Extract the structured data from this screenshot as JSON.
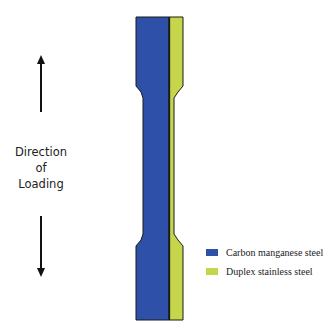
{
  "diagram": {
    "type": "tensile-specimen-schematic",
    "direction_label_lines": [
      "Direction",
      "of",
      "Loading"
    ],
    "arrows": [
      {
        "name": "up-arrow",
        "direction": "up"
      },
      {
        "name": "down-arrow",
        "direction": "down"
      }
    ],
    "materials": {
      "carbon": {
        "label": "Carbon manganese steel",
        "color": "#2e50a8"
      },
      "duplex": {
        "label": "Duplex stainless steel",
        "color": "#c6d64a"
      }
    }
  },
  "legend": {
    "items": [
      {
        "label": "Carbon manganese steel",
        "color": "#2e50a8"
      },
      {
        "label": "Duplex stainless steel",
        "color": "#c6d64a"
      }
    ]
  }
}
